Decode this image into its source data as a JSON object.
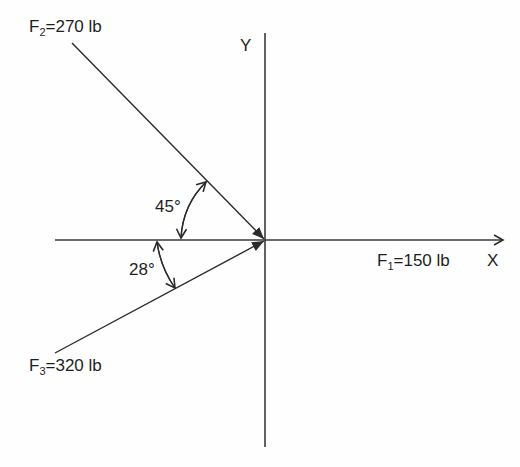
{
  "axes": {
    "x_label": "X",
    "y_label": "Y"
  },
  "forces": [
    {
      "name": "F",
      "sub": "1",
      "magnitude": "=150 lb",
      "direction_note": "along +X axis"
    },
    {
      "name": "F",
      "sub": "2",
      "magnitude": "=270 lb",
      "direction_note": "45° above -X axis, pointing toward origin"
    },
    {
      "name": "F",
      "sub": "3",
      "magnitude": "=320 lb",
      "direction_note": "28° below -X axis, pointing toward origin"
    }
  ],
  "angles": [
    {
      "label": "45°",
      "between": "F2 and -X axis"
    },
    {
      "label": "28°",
      "between": "F3 and -X axis"
    }
  ],
  "colors": {
    "line": "#2a2a2a",
    "text": "#1e1e1e",
    "background": "#fefefe"
  }
}
